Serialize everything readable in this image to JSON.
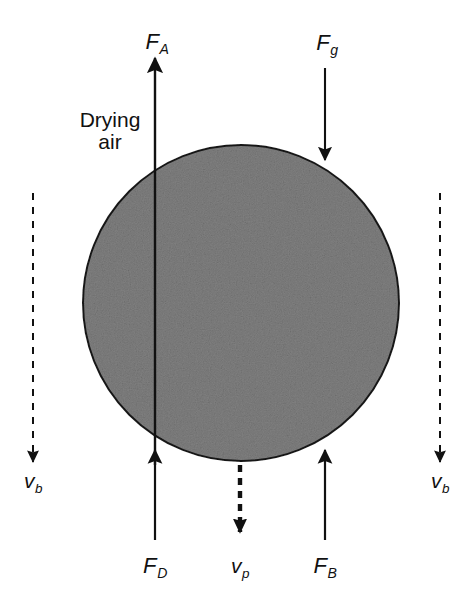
{
  "figure": {
    "domain": "diagram",
    "width": 470,
    "height": 601,
    "background_color": "#ffffff",
    "ink_color": "#111111"
  },
  "particle": {
    "name": "drying particle",
    "shape": "circle",
    "center_x": 241,
    "center_y": 303,
    "radius": 158,
    "fill_color": "#808080",
    "fill_texture": "speckled-gray",
    "stroke_color": "#1a1a1a",
    "stroke_width": 2
  },
  "annotations": {
    "drying_air": {
      "line1": "Drying",
      "line2": "air",
      "x": 110,
      "y": 131
    }
  },
  "force_arrows": [
    {
      "id": "F_A",
      "symbol": "F",
      "subscript": "A",
      "meaning": "acceleration force",
      "direction": "up",
      "x": 155,
      "tail_y": 465,
      "head_y": 58,
      "label_x": 157,
      "label_y": 42,
      "style": "solid"
    },
    {
      "id": "F_g",
      "symbol": "F",
      "subscript": "g",
      "meaning": "gravity force",
      "direction": "down",
      "x": 325,
      "tail_y": 68,
      "head_y": 160,
      "label_x": 327,
      "label_y": 43,
      "style": "solid"
    },
    {
      "id": "F_D",
      "symbol": "F",
      "subscript": "D",
      "meaning": "drag force",
      "direction": "up",
      "x": 155,
      "tail_y": 540,
      "head_y": 450,
      "label_x": 155,
      "label_y": 566,
      "style": "solid"
    },
    {
      "id": "F_B",
      "symbol": "F",
      "subscript": "B",
      "meaning": "buoyancy force",
      "direction": "up",
      "x": 325,
      "tail_y": 540,
      "head_y": 450,
      "label_x": 325,
      "label_y": 566,
      "style": "solid"
    }
  ],
  "velocity_arrows": [
    {
      "id": "v_b_left",
      "symbol": "v",
      "subscript": "b",
      "meaning": "bulk air velocity",
      "direction": "down",
      "x": 33,
      "tail_y": 193,
      "head_y": 462,
      "label_x": 33,
      "label_y": 481,
      "style": "dashed",
      "stroke_width": 2
    },
    {
      "id": "v_b_right",
      "symbol": "v",
      "subscript": "b",
      "meaning": "bulk air velocity",
      "direction": "down",
      "x": 440,
      "tail_y": 193,
      "head_y": 462,
      "label_x": 440,
      "label_y": 481,
      "style": "dashed",
      "stroke_width": 2
    },
    {
      "id": "v_p",
      "symbol": "v",
      "subscript": "p",
      "meaning": "particle velocity",
      "direction": "down",
      "x": 240,
      "tail_y": 465,
      "head_y": 532,
      "label_x": 240,
      "label_y": 566,
      "style": "dashed",
      "stroke_width": 4
    }
  ]
}
